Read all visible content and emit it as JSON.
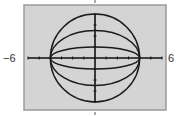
{
  "chart_data": {
    "type": "line",
    "title": "",
    "xlabel": "",
    "ylabel": "",
    "xlim": [
      -6,
      6
    ],
    "ylim": [
      -4,
      4
    ],
    "x_tick_step": 1,
    "y_tick_step": 1,
    "grid": false,
    "x_end_labels": [
      "−6",
      "6"
    ],
    "series": [
      {
        "name": "ellipse b=4",
        "equation": "x^2/16 + y^2/16 = 1",
        "a": 4,
        "b": 4
      },
      {
        "name": "ellipse b=2.5",
        "equation": "x^2/16 + y^2/6.25 = 1",
        "a": 4,
        "b": 2.5
      },
      {
        "name": "ellipse b=1",
        "equation": "x^2/16 + y^2/1 = 1",
        "a": 4,
        "b": 1
      }
    ]
  },
  "colors": {
    "window_bg": "#d4d4d4",
    "frame": "#9a9a9a",
    "curve": "#1a1a1a",
    "axis": "#111111"
  }
}
